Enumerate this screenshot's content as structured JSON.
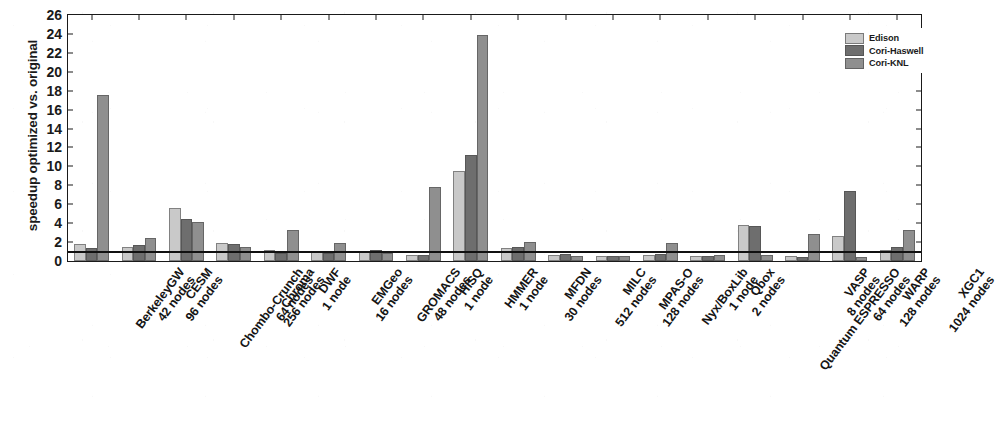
{
  "chart_data": {
    "type": "bar",
    "title": "",
    "xlabel": "",
    "ylabel": "speedup optimized vs. original",
    "ylim": [
      0,
      26
    ],
    "yticks": [
      0,
      2,
      4,
      6,
      8,
      10,
      12,
      14,
      16,
      18,
      20,
      22,
      24,
      26
    ],
    "grid": false,
    "reference_line": 1,
    "legend_position": "top-right",
    "categories": [
      "BerkeleyGW\n42 nodes",
      "CESM\n96 nodes",
      "Chombo-Crunch\n64 nodes",
      "Chroma\n256 nodes",
      "DWF\n1 node",
      "EMGeo\n16 nodes",
      "GROMACS\n48 nodes",
      "HISQ\n1 node",
      "HMMER\n1 node",
      "MFDN\n30 nodes",
      "MILC\n512 nodes",
      "MPAS-O\n128 nodes",
      "Nyx/BoxLib\n1 node",
      "Qbox\n2 nodes",
      "Quantum ESPRESSO\n64 nodes",
      "VASP\n8 nodes",
      "WARP\n128 nodes",
      "XGC1\n1024 nodes"
    ],
    "category_names": [
      "BerkeleyGW",
      "CESM",
      "Chombo-Crunch",
      "Chroma",
      "DWF",
      "EMGeo",
      "GROMACS",
      "HISQ",
      "HMMER",
      "MFDN",
      "MILC",
      "MPAS-O",
      "Nyx/BoxLib",
      "Qbox",
      "Quantum ESPRESSO",
      "VASP",
      "WARP",
      "XGC1"
    ],
    "category_nodes": [
      "42 nodes",
      "96 nodes",
      "64 nodes",
      "256 nodes",
      "1 node",
      "16 nodes",
      "48 nodes",
      "1 node",
      "1 node",
      "30 nodes",
      "512 nodes",
      "128 nodes",
      "1 node",
      "2 nodes",
      "64 nodes",
      "8 nodes",
      "128 nodes",
      "1024 nodes"
    ],
    "series": [
      {
        "name": "Edison",
        "color": "#c9c9c9",
        "values": [
          1.8,
          1.5,
          5.6,
          1.9,
          1.2,
          1.0,
          1.1,
          0.6,
          9.5,
          1.4,
          0.6,
          0.5,
          0.6,
          0.5,
          3.8,
          0.5,
          2.6,
          1.2
        ]
      },
      {
        "name": "Cori-Haswell",
        "color": "#6e6e6e",
        "values": [
          1.4,
          1.7,
          4.4,
          1.8,
          0.9,
          0.9,
          1.2,
          0.6,
          11.2,
          1.5,
          0.7,
          0.5,
          0.7,
          0.5,
          3.7,
          0.4,
          7.4,
          1.5
        ]
      },
      {
        "name": "Cori-KNL",
        "color": "#8f8f8f",
        "values": [
          17.5,
          2.4,
          4.1,
          1.5,
          3.3,
          1.9,
          0.8,
          7.8,
          23.9,
          2.0,
          0.5,
          0.5,
          1.9,
          0.6,
          0.6,
          2.9,
          0.4,
          3.3
        ]
      }
    ]
  },
  "legend": {
    "items": [
      {
        "label": "Edison",
        "color": "#c9c9c9"
      },
      {
        "label": "Cori-Haswell",
        "color": "#6e6e6e"
      },
      {
        "label": "Cori-KNL",
        "color": "#8f8f8f"
      }
    ]
  }
}
